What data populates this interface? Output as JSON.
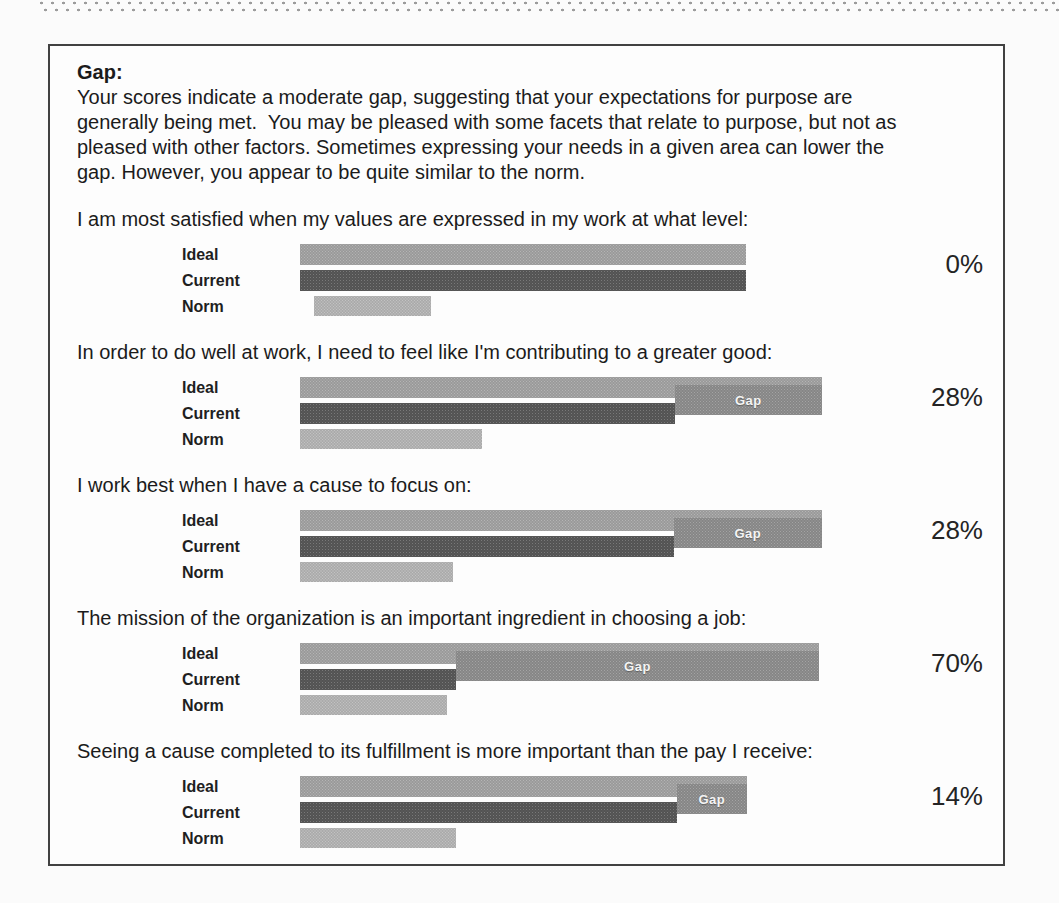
{
  "page": {
    "heading": "Gap:"
  },
  "labels": {
    "ideal": "Ideal",
    "current": "Current",
    "norm": "Norm",
    "gap": "Gap"
  },
  "colors": {
    "page-bg": "#fbfbfb",
    "box-border": "#414141",
    "text": "#1b1b1b",
    "dots": "#9c9c9c",
    "bar-ideal": "#a2a2a2",
    "bar-current": "#575757",
    "bar-norm": "#b4b4b4",
    "gap-box": "#8d8d8d",
    "gap-text": "#f4f4f4"
  },
  "chart_data": [
    {
      "type": "bar",
      "orientation": "horizontal",
      "question": "I am most satisfied when my values are expressed in my work at what level:",
      "categories": [
        "Ideal",
        "Current",
        "Norm"
      ],
      "values_pct_of_scale": [
        85.4,
        85.4,
        22.4
      ],
      "gap_label": "0%",
      "gap_value_pct": 0,
      "show_gap_box": false,
      "norm_indent_pct": 2.7
    },
    {
      "type": "bar",
      "orientation": "horizontal",
      "question": "In order to do well at work, I need to feel like I'm contributing to a greater good:",
      "categories": [
        "Ideal",
        "Current",
        "Norm"
      ],
      "values_pct_of_scale": [
        100,
        71.8,
        34.9
      ],
      "gap_label": "28%",
      "gap_value_pct": 28,
      "show_gap_box": true,
      "norm_indent_pct": 0
    },
    {
      "type": "bar",
      "orientation": "horizontal",
      "question": "I work best when I have a cause to focus on:",
      "categories": [
        "Ideal",
        "Current",
        "Norm"
      ],
      "values_pct_of_scale": [
        100,
        71.6,
        29.3
      ],
      "gap_label": "28%",
      "gap_value_pct": 28,
      "show_gap_box": true,
      "norm_indent_pct": 0
    },
    {
      "type": "bar",
      "orientation": "horizontal",
      "question": "The mission of the organization is an important ingredient in choosing a job:",
      "categories": [
        "Ideal",
        "Current",
        "Norm"
      ],
      "values_pct_of_scale": [
        99.4,
        29.9,
        28.2
      ],
      "gap_label": "70%",
      "gap_value_pct": 70,
      "show_gap_box": true,
      "norm_indent_pct": 0
    },
    {
      "type": "bar",
      "orientation": "horizontal",
      "question": "Seeing a cause completed to its fulfillment is more important than the pay I receive:",
      "categories": [
        "Ideal",
        "Current",
        "Norm"
      ],
      "values_pct_of_scale": [
        85.6,
        72.2,
        29.9
      ],
      "gap_label": "14%",
      "gap_value_pct": 14,
      "show_gap_box": true,
      "norm_indent_pct": 0
    }
  ]
}
